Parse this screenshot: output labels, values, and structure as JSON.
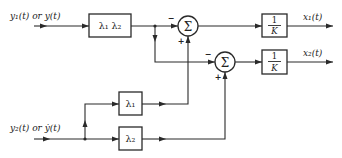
{
  "diagram": {
    "type": "block-diagram",
    "inputs": {
      "y1": "y₁(t) or y(t)",
      "y2": "y₂(t) or ẏ(t)"
    },
    "outputs": {
      "x1": "x₁(t)",
      "x2": "x₂(t)"
    },
    "blocks": {
      "lambda12": "λ₁ λ₂",
      "lambda1": "λ₁",
      "lambda2": "λ₂",
      "gain1_num": "1",
      "gain1_den": "K",
      "gain2_num": "1",
      "gain2_den": "K"
    },
    "summers": {
      "sum1": {
        "symbol": "Σ",
        "left_sign": "−",
        "bottom_sign": "+"
      },
      "sum2": {
        "symbol": "Σ",
        "left_sign": "−",
        "bottom_sign": "+"
      }
    },
    "colors": {
      "line": "#2a2a2a",
      "background": "#ffffff"
    }
  }
}
